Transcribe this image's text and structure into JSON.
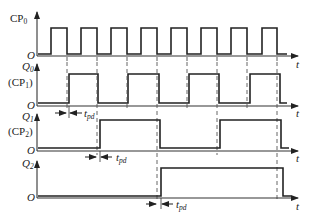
{
  "diagram": {
    "title": "",
    "type": "timing-diagram",
    "time_axis_label": "t",
    "origin_label": "O",
    "delay_label": "t",
    "delay_label_sub": "pd",
    "signals": [
      {
        "name": "CP",
        "sub": "0",
        "alias": "",
        "alias_sub": ""
      },
      {
        "name": "Q",
        "sub": "0",
        "alias": "(CP",
        "alias_sub": "1",
        "alias_close": ")"
      },
      {
        "name": "Q",
        "sub": "1",
        "alias": "(CP",
        "alias_sub": "2",
        "alias_close": ")"
      },
      {
        "name": "Q",
        "sub": "2",
        "alias": "",
        "alias_sub": ""
      }
    ]
  }
}
